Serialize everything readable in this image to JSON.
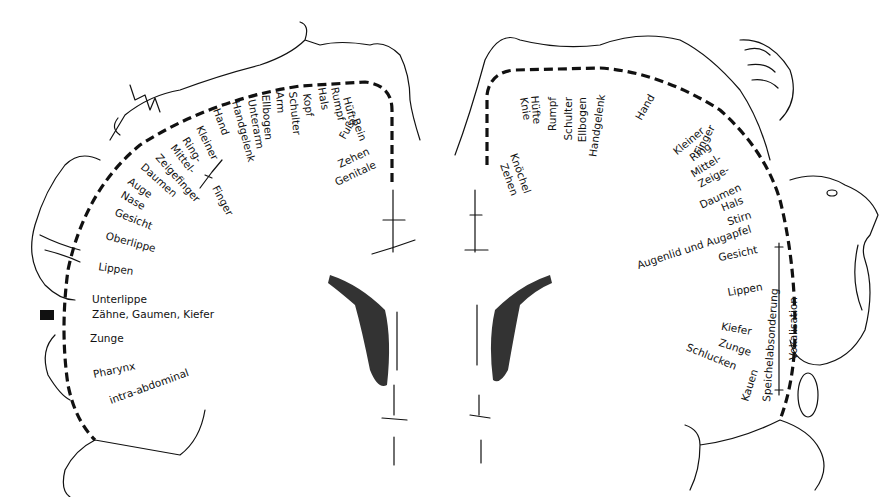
{
  "figure": {
    "type": "cortical-homunculus",
    "left_hemisphere": {
      "title": "sensory",
      "labels": [
        "Zehen",
        "Genitale",
        "Fuß",
        "Bein",
        "Hüfte",
        "Rumpf",
        "Hals",
        "Kopf",
        "Schulter",
        "Arm",
        "Ellbogen",
        "Unterarm",
        "Handgelenk",
        "Hand",
        "Kleiner",
        "Ring-",
        "Mittel-",
        "Zeigefinger",
        "Daumen",
        "Finger",
        "Auge",
        "Nase",
        "Gesicht",
        "Oberlippe",
        "Lippen",
        "Unterlippe",
        "Zähne, Gaumen, Kiefer",
        "Zunge",
        "Pharynx",
        "intra-abdominal"
      ]
    },
    "right_hemisphere": {
      "title": "motor",
      "labels": [
        "Zehen",
        "Knöchel",
        "Knie",
        "Hüfte",
        "Rumpf",
        "Schulter",
        "Ellbogen",
        "Handgelenk",
        "Hand",
        "Kleiner",
        "Ring",
        "Mittel-",
        "Zeige-",
        "Finger",
        "Daumen",
        "Hals",
        "Stirn",
        "Augenlid und Augapfel",
        "Gesicht",
        "Lippen",
        "Kiefer",
        "Zunge",
        "Schlucken",
        "Kauen",
        "Speichelabsonderung",
        "Vokalisation"
      ]
    }
  },
  "L": {
    "zehen": "Zehen",
    "genitale": "Genitale",
    "fuss": "Fuß",
    "bein": "Bein",
    "huefte": "Hüfte",
    "rumpf": "Rumpf",
    "hals": "Hals",
    "kopf": "Kopf",
    "schulter": "Schulter",
    "arm": "Arm",
    "ellbogen": "Ellbogen",
    "unterarm": "Unterarm",
    "handgelenk": "Handgelenk",
    "hand": "Hand",
    "kleiner": "Kleiner",
    "ring": "Ring-",
    "mittel": "Mittel-",
    "zeigefinger": "Zeigefinger",
    "daumen": "Daumen",
    "finger": "Finger",
    "auge": "Auge",
    "nase": "Nase",
    "gesicht": "Gesicht",
    "oberlippe": "Oberlippe",
    "lippen": "Lippen",
    "unterlippe": "Unterlippe",
    "zaehne": "Zähne, Gaumen, Kiefer",
    "zunge": "Zunge",
    "pharynx": "Pharynx",
    "intra": "intra-abdominal"
  },
  "R": {
    "zehen": "Zehen",
    "knoechel": "Knöchel",
    "knie": "Knie",
    "huefte": "Hüfte",
    "rumpf": "Rumpf",
    "schulter": "Schulter",
    "ellbogen": "Ellbogen",
    "handgelenk": "Handgelenk",
    "hand": "Hand",
    "kleiner": "Kleiner",
    "ring": "Ring",
    "mittel": "Mittel-",
    "zeige": "Zeige-",
    "finger": "Finger",
    "daumen": "Daumen",
    "hals": "Hals",
    "stirn": "Stirn",
    "augenlid": "Augenlid und Augapfel",
    "gesicht": "Gesicht",
    "lippen": "Lippen",
    "kiefer": "Kiefer",
    "zunge": "Zunge",
    "schlucken": "Schlucken",
    "kauen": "Kauen",
    "speichel": "Speichelabsonderung",
    "vokal": "Vokalisation"
  }
}
